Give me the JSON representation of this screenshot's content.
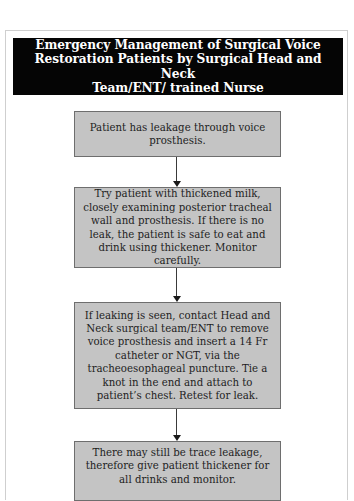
{
  "title": "Emergency Management of Surgical Voice Restoration Patients by Surgical Head and Neck Team/ENT/ trained Nurse",
  "title_lines": [
    "Emergency Management of Surgical Voice",
    "Restoration Patients by Surgical Head and Neck",
    "Team/ENT/ trained Nurse"
  ],
  "steps": [
    {
      "text": "Patient has leakage through voice prosthesis."
    },
    {
      "text": "Try patient with thickened milk, closely examining posterior tracheal wall and prosthesis. If there is no leak, the patient is safe to eat and drink using thickener. Monitor carefully."
    },
    {
      "text": "If leaking is seen, contact Head and Neck surgical team/ENT to remove voice prosthesis and insert a 14 Fr catheter or NGT, via the tracheoesophageal puncture. Tie a knot in the end and attach to patient’s chest.  Retest for leak."
    },
    {
      "text": "There may still be trace leakage, therefore give patient thickener for all drinks and monitor."
    }
  ],
  "colors": {
    "title_background": "#050505",
    "title_text": "#ffffff",
    "box_fill": "#c4c4c4",
    "box_border": "#6e6e6e",
    "arrow": "#1a1a1a"
  }
}
